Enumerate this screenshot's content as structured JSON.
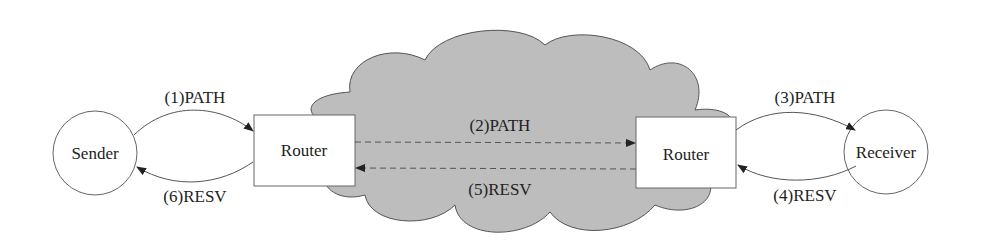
{
  "diagram": {
    "nodes": {
      "sender": {
        "label": "Sender"
      },
      "router_left": {
        "label": "Router"
      },
      "router_right": {
        "label": "Router"
      },
      "receiver": {
        "label": "Receiver"
      }
    },
    "messages": {
      "m1": "(1)PATH",
      "m2": "(2)PATH",
      "m3": "(3)PATH",
      "m4": "(4)RESV",
      "m5": "(5)RESV",
      "m6": "(6)RESV"
    },
    "colors": {
      "cloud_fill": "#bdbdbd",
      "stroke": "#555555",
      "node_fill": "#ffffff"
    }
  }
}
